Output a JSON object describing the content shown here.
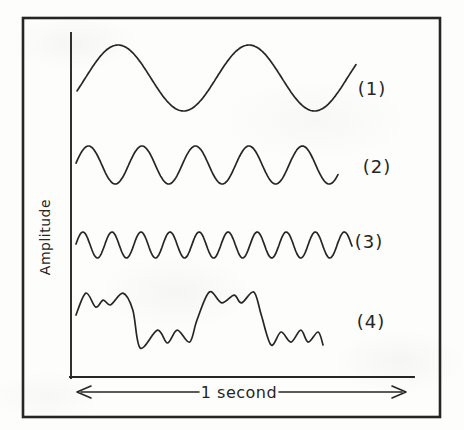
{
  "figure": {
    "ink_color": "#262626",
    "paper_color": "#fdfdfb"
  },
  "chart_data": {
    "type": "line",
    "xlabel": "1 second",
    "ylabel": "Amplitude",
    "x_range_seconds": [
      0,
      1
    ],
    "grid": false,
    "legend_position": "inline label right of each curve",
    "series": [
      {
        "label": "(1)",
        "waveform": "sine",
        "frequency_hz": 2,
        "cycles_shown": 2.13,
        "phase_rad": -0.4,
        "relative_amplitude": 1.0
      },
      {
        "label": "(2)",
        "waveform": "sine",
        "frequency_hz": 5,
        "cycles_shown": 4.9,
        "phase_rad": 0.1,
        "relative_amplitude": 0.58
      },
      {
        "label": "(3)",
        "waveform": "sine",
        "frequency_hz": 10,
        "cycles_shown": 9.5,
        "phase_rad": 0.08,
        "relative_amplitude": 0.4
      },
      {
        "label": "(4)",
        "waveform": "composite",
        "components": "~2 Hz square-like wave plus ~10 Hz ripple",
        "relative_amplitude": 0.85,
        "points": [
          [
            0.0,
            0.18
          ],
          [
            0.04,
            0.96
          ],
          [
            0.08,
            0.46
          ],
          [
            0.11,
            0.71
          ],
          [
            0.14,
            0.54
          ],
          [
            0.19,
            0.96
          ],
          [
            0.23,
            0.36
          ],
          [
            0.26,
            -1.0
          ],
          [
            0.33,
            -0.36
          ],
          [
            0.37,
            -0.82
          ],
          [
            0.41,
            -0.36
          ],
          [
            0.46,
            -0.79
          ],
          [
            0.49,
            0.0
          ],
          [
            0.54,
            1.0
          ],
          [
            0.59,
            0.61
          ],
          [
            0.64,
            0.89
          ],
          [
            0.67,
            0.61
          ],
          [
            0.72,
            1.0
          ],
          [
            0.75,
            0.18
          ],
          [
            0.79,
            -0.89
          ],
          [
            0.83,
            -0.43
          ],
          [
            0.87,
            -0.79
          ],
          [
            0.91,
            -0.36
          ],
          [
            0.94,
            -0.79
          ],
          [
            0.98,
            -0.43
          ],
          [
            1.0,
            -0.89
          ]
        ]
      }
    ],
    "layout": {
      "series_rows_px": [
        {
          "x0": 77,
          "x1": 356,
          "center_y": 78,
          "amplitude_px": 33
        },
        {
          "x0": 76,
          "x1": 338,
          "center_y": 165,
          "amplitude_px": 19
        },
        {
          "x0": 76,
          "x1": 352,
          "center_y": 245,
          "amplitude_px": 13
        },
        {
          "x0": 76,
          "x1": 323,
          "center_y": 320,
          "amplitude_px": 28
        }
      ]
    }
  }
}
